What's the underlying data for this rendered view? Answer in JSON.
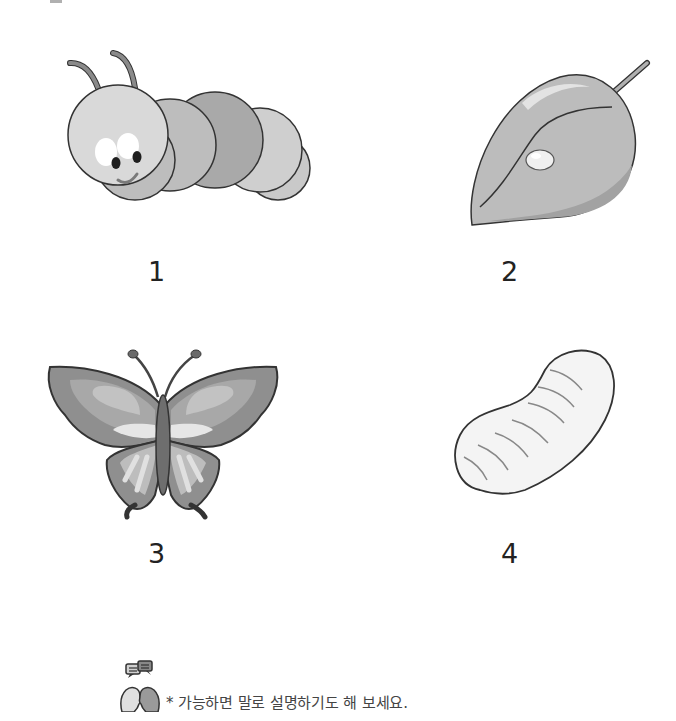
{
  "worksheet": {
    "stages": [
      {
        "number": "1",
        "name": "caterpillar"
      },
      {
        "number": "2",
        "name": "egg-on-leaf"
      },
      {
        "number": "3",
        "name": "butterfly"
      },
      {
        "number": "4",
        "name": "pupa"
      }
    ],
    "footer": {
      "icon": "conversation-icon",
      "note": "* 가능하면 말로 설명하기도 해 보세요."
    }
  },
  "colors": {
    "outline": "#333333",
    "light_gray": "#d6d6d6",
    "mid_gray": "#b5b5b5",
    "dark_gray": "#8a8a8a"
  }
}
